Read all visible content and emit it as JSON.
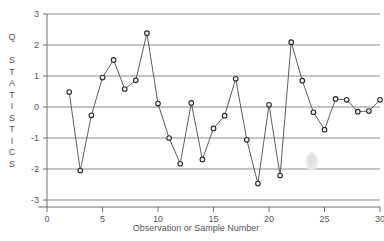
{
  "chart_data": {
    "type": "line",
    "title": "",
    "xlabel": "Observation or Sample Number",
    "ylabel": "Q STATISTICS",
    "xlim": [
      0,
      30
    ],
    "ylim": [
      -3,
      3
    ],
    "grid": true,
    "legend": "none",
    "marker": "open-circle",
    "xticks": [
      0,
      5,
      10,
      15,
      20,
      25,
      30
    ],
    "xtick_labels": [
      "0",
      "5",
      "10",
      "15",
      "20",
      "25",
      "30"
    ],
    "yticks": [
      -3,
      -2,
      -1,
      0,
      1,
      2,
      3
    ],
    "ytick_labels": [
      "-3",
      "-2",
      "-1",
      "0",
      "1",
      "2",
      "3"
    ],
    "x": [
      2,
      3,
      4,
      5,
      6,
      7,
      8,
      9,
      10,
      11,
      12,
      13,
      14,
      15,
      16,
      17,
      18,
      19,
      20,
      21,
      22,
      23,
      24,
      25,
      26,
      27,
      28,
      29,
      30
    ],
    "values": [
      0.48,
      -2.05,
      -0.27,
      0.95,
      1.52,
      0.58,
      0.86,
      2.38,
      0.11,
      -1.0,
      -1.83,
      0.13,
      -1.69,
      -0.69,
      -0.28,
      0.91,
      -1.06,
      -2.47,
      0.07,
      -2.21,
      2.09,
      0.85,
      -0.17,
      -0.73,
      0.26,
      0.23,
      -0.15,
      -0.13,
      0.23
    ],
    "series": [
      {
        "name": "Q statistic",
        "values": [
          0.48,
          -2.05,
          -0.27,
          0.95,
          1.52,
          0.58,
          0.86,
          2.38,
          0.11,
          -1.0,
          -1.83,
          0.13,
          -1.69,
          -0.69,
          -0.28,
          0.91,
          -1.06,
          -2.47,
          0.07,
          -2.21,
          2.09,
          0.85,
          -0.17,
          -0.73,
          0.26,
          0.23,
          -0.15,
          -0.13,
          0.23
        ]
      }
    ],
    "ylabel_letters": [
      "Q",
      "",
      "S",
      "T",
      "A",
      "T",
      "I",
      "S",
      "T",
      "I",
      "C",
      "S"
    ],
    "colors": {
      "line": "#4d4d4d",
      "marker_fill": "#f2f2f2",
      "marker_stroke": "#2b2b2b",
      "grid": "#8c8c8e",
      "axis": "#6e6e70",
      "text": "#58585a",
      "background": "#ffffff"
    }
  }
}
